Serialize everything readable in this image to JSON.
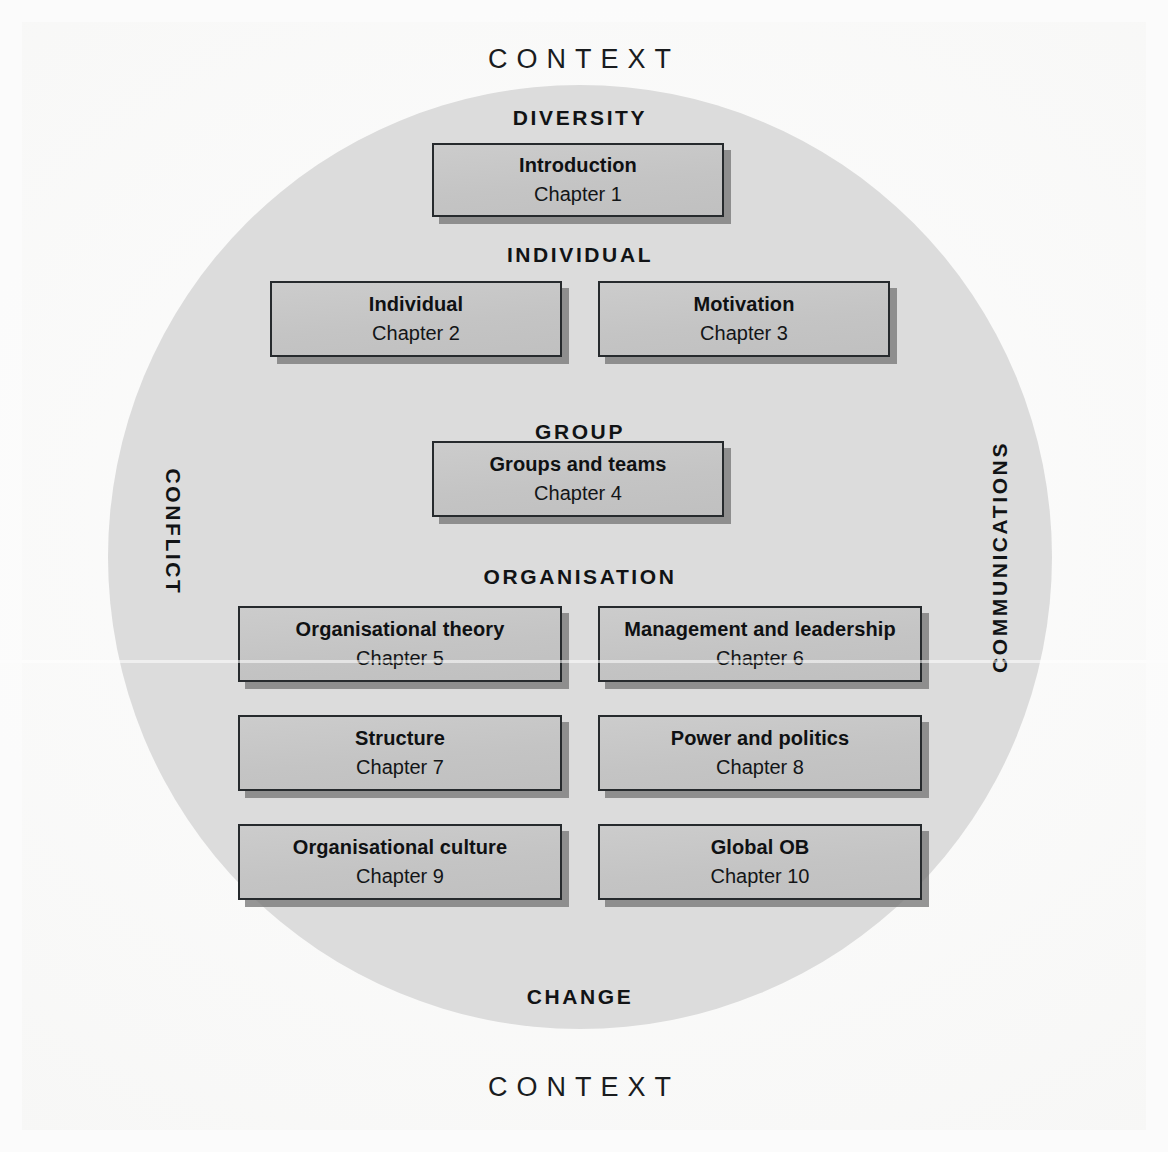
{
  "diagram": {
    "type": "concentric-framework",
    "outer_labels": {
      "top": "CONTEXT",
      "bottom": "CONTEXT"
    },
    "circle": {
      "fill_color": "#dcdcdc",
      "band_labels": {
        "diversity": "DIVERSITY",
        "individual": "INDIVIDUAL",
        "group": "GROUP",
        "organisation": "ORGANISATION",
        "change": "CHANGE"
      },
      "side_labels": {
        "left": "CONFLICT",
        "right": "COMMUNICATIONS"
      }
    },
    "box_style": {
      "fill_color": "#c6c6c6",
      "border_color": "#262a2d",
      "shadow_color": "#787878"
    },
    "levels": [
      {
        "name": "diversity",
        "heading": "DIVERSITY",
        "boxes": [
          {
            "title": "Introduction",
            "chapter": "Chapter 1"
          }
        ]
      },
      {
        "name": "individual",
        "heading": "INDIVIDUAL",
        "boxes": [
          {
            "title": "Individual",
            "chapter": "Chapter 2"
          },
          {
            "title": "Motivation",
            "chapter": "Chapter 3"
          }
        ]
      },
      {
        "name": "group",
        "heading": "GROUP",
        "boxes": [
          {
            "title": "Groups and teams",
            "chapter": "Chapter 4"
          }
        ]
      },
      {
        "name": "organisation",
        "heading": "ORGANISATION",
        "boxes": [
          {
            "title": "Organisational theory",
            "chapter": "Chapter 5"
          },
          {
            "title": "Management and leadership",
            "chapter": "Chapter 6"
          },
          {
            "title": "Structure",
            "chapter": "Chapter 7"
          },
          {
            "title": "Power and politics",
            "chapter": "Chapter 8"
          },
          {
            "title": "Organisational culture",
            "chapter": "Chapter 9"
          },
          {
            "title": "Global OB",
            "chapter": "Chapter 10"
          }
        ]
      }
    ]
  }
}
